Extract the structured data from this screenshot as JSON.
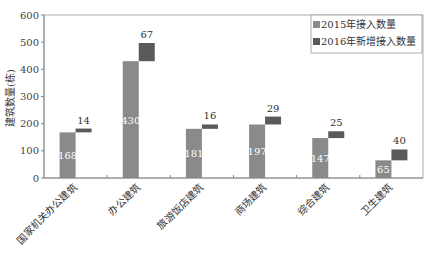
{
  "chart_data": {
    "type": "bar",
    "subtype": "stacked-offset",
    "title": "",
    "xlabel": "",
    "ylabel": "建筑数量(栋)",
    "ylim": [
      0,
      600
    ],
    "yticks": [
      0,
      100,
      200,
      300,
      400,
      500,
      600
    ],
    "grid": false,
    "legend_position": "top-right",
    "categories": [
      "国家机关办公建筑",
      "办公建筑",
      "旅游饭店建筑",
      "商场建筑",
      "综合建筑",
      "卫生建筑"
    ],
    "series": [
      {
        "name": "2015年接入数量",
        "color": "#8a8a8a",
        "values": [
          168,
          430,
          181,
          197,
          147,
          65
        ]
      },
      {
        "name": "2016年新增接入数量",
        "color": "#5a5a5a",
        "values": [
          14,
          67,
          16,
          29,
          25,
          40
        ]
      }
    ]
  },
  "labels": {
    "ylabel": "建筑数量(栋)",
    "legend": [
      "2015年接入数量",
      "2016年新增接入数量"
    ],
    "yticks": [
      "0",
      "100",
      "200",
      "300",
      "400",
      "500",
      "600"
    ],
    "categories": [
      "国家机关办公建筑",
      "办公建筑",
      "旅游饭店建筑",
      "商场建筑",
      "综合建筑",
      "卫生建筑"
    ],
    "base_values": [
      "168",
      "430",
      "181",
      "197",
      "147",
      "65"
    ],
    "increment_values": [
      "14",
      "67",
      "16",
      "29",
      "25",
      "40"
    ]
  }
}
